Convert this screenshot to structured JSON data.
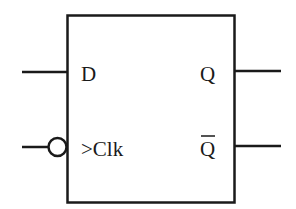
{
  "diagram": {
    "inputs": {
      "d": "D",
      "clk": ">Clk"
    },
    "outputs": {
      "q": "Q",
      "q_bar": "Q"
    },
    "stroke_color": "#1a1a1a"
  }
}
